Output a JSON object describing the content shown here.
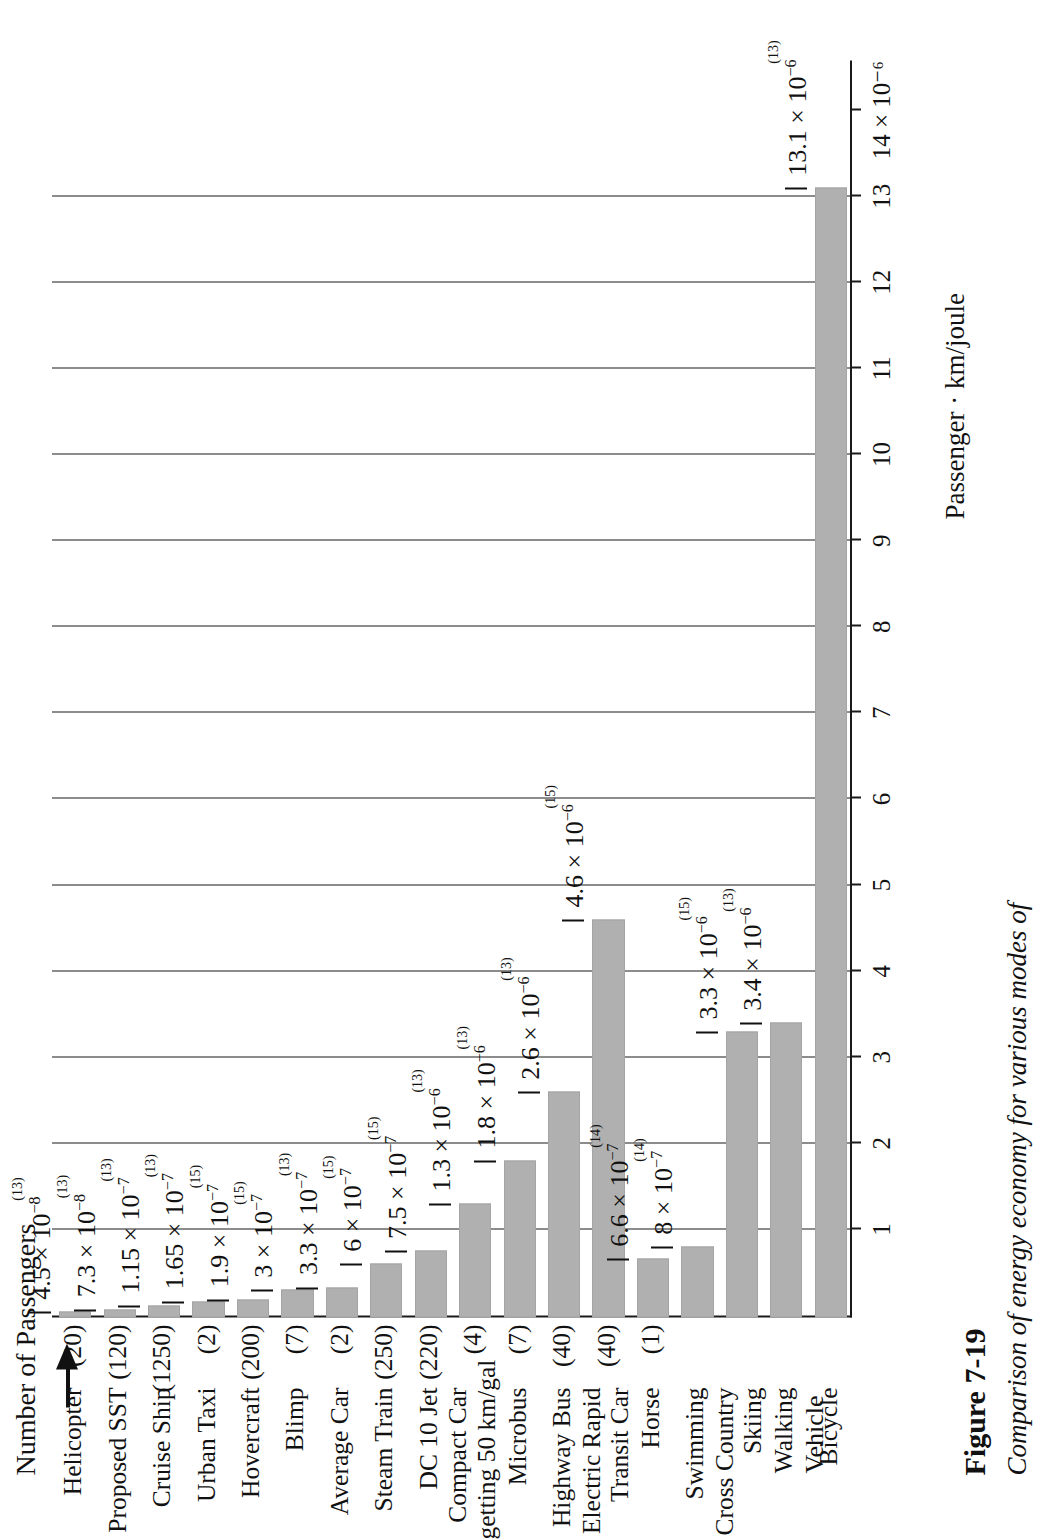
{
  "figure": {
    "number_label": "Figure 7-19",
    "caption": "Comparison of energy economy for various modes of",
    "vehicle_heading": "Vehicle",
    "passengers_heading": "Number of Passengers",
    "axis_title": "Passenger · km/joule",
    "bar_color": "#b0b0b0",
    "axis_color": "#1a1a1a"
  },
  "chart_data": {
    "type": "bar",
    "orientation": "horizontal",
    "xlabel": "Passenger · km/joule",
    "ylabel": "Vehicle",
    "unit_exponent": "10^-6",
    "xlim": [
      0,
      14.6
    ],
    "grid": true,
    "tick_values": [
      1,
      2,
      3,
      4,
      5,
      6,
      7,
      8,
      9,
      10,
      11,
      12,
      13,
      14
    ],
    "tick_labels": [
      "1",
      "2",
      "3",
      "4",
      "5",
      "6",
      "7",
      "8",
      "9",
      "10",
      "11",
      "12",
      "13",
      "14 × 10⁻⁶"
    ],
    "categories": [
      "Helicopter",
      "Proposed SST",
      "Cruise Ship",
      "Urban Taxi",
      "Hovercraft",
      "Blimp",
      "Average Car",
      "Steam Train",
      "DC 10 Jet",
      "Compact Car getting 50 km/gal",
      "Microbus",
      "Highway Bus",
      "Electric Rapid Transit Car",
      "Horse",
      "Swimming",
      "Cross Country Skiing",
      "Walking",
      "Bicycle"
    ],
    "values_in_1e6": [
      0.045,
      0.073,
      0.115,
      0.165,
      0.19,
      0.3,
      0.33,
      0.6,
      0.75,
      1.3,
      1.8,
      2.6,
      4.6,
      0.66,
      0.8,
      3.3,
      3.4,
      13.1
    ],
    "values": [
      4.5e-08,
      7.3e-08,
      1.15e-07,
      1.65e-07,
      1.9e-07,
      3e-07,
      3.3e-07,
      6e-07,
      7.5e-07,
      1.3e-06,
      1.8e-06,
      2.6e-06,
      4.6e-06,
      6.6e-07,
      8e-07,
      3.3e-06,
      3.4e-06,
      1.31e-05
    ]
  },
  "rows": [
    {
      "name": "Helicopter",
      "name_lines": [
        "Helicopter"
      ],
      "passengers": "(20)",
      "mant": "4.5",
      "exp": "−8",
      "ref": "(13)",
      "v": 0.045
    },
    {
      "name": "Proposed SST",
      "name_lines": [
        "Proposed SST"
      ],
      "passengers": "(120)",
      "mant": "7.3",
      "exp": "−8",
      "ref": "(13)",
      "v": 0.073
    },
    {
      "name": "Cruise Ship",
      "name_lines": [
        "Cruise Ship"
      ],
      "passengers": "(1250)",
      "mant": "1.15",
      "exp": "−7",
      "ref": "(13)",
      "v": 0.115
    },
    {
      "name": "Urban Taxi",
      "name_lines": [
        "Urban Taxi"
      ],
      "passengers": "(2)",
      "mant": "1.65",
      "exp": "−7",
      "ref": "(13)",
      "v": 0.165
    },
    {
      "name": "Hovercraft",
      "name_lines": [
        "Hovercraft"
      ],
      "passengers": "(200)",
      "mant": "1.9",
      "exp": "−7",
      "ref": "(15)",
      "v": 0.19
    },
    {
      "name": "Blimp",
      "name_lines": [
        "Blimp"
      ],
      "passengers": "(7)",
      "mant": "3",
      "exp": "−7",
      "ref": "(15)",
      "v": 0.3
    },
    {
      "name": "Average Car",
      "name_lines": [
        "Average Car"
      ],
      "passengers": "(2)",
      "mant": "3.3",
      "exp": "−7",
      "ref": "(13)",
      "v": 0.33
    },
    {
      "name": "Steam Train",
      "name_lines": [
        "Steam Train"
      ],
      "passengers": "(250)",
      "mant": "6",
      "exp": "−7",
      "ref": "(15)",
      "v": 0.6
    },
    {
      "name": "DC 10 Jet",
      "name_lines": [
        "DC 10 Jet"
      ],
      "passengers": "(220)",
      "mant": "7.5",
      "exp": "−7",
      "ref": "(15)",
      "v": 0.75
    },
    {
      "name": "Compact Car getting 50 km/gal",
      "name_lines": [
        "Compact Car",
        "getting 50 km/gal"
      ],
      "passengers": "(4)",
      "mant": "1.3",
      "exp": "−6",
      "ref": "(13)",
      "v": 1.3
    },
    {
      "name": "Microbus",
      "name_lines": [
        "Microbus"
      ],
      "passengers": "(7)",
      "mant": "1.8",
      "exp": "−6",
      "ref": "(13)",
      "v": 1.8
    },
    {
      "name": "Highway Bus",
      "name_lines": [
        "Highway Bus"
      ],
      "passengers": "(40)",
      "mant": "2.6",
      "exp": "−6",
      "ref": "(13)",
      "v": 2.6
    },
    {
      "name": "Electric Rapid Transit Car",
      "name_lines": [
        "Electric Rapid",
        "Transit Car"
      ],
      "passengers": "(40)",
      "mant": "4.6",
      "exp": "−6",
      "ref": "(15)",
      "v": 4.6
    },
    {
      "name": "Horse",
      "name_lines": [
        "Horse"
      ],
      "passengers": "(1)",
      "mant": "6.6",
      "exp": "−7",
      "ref": "(14)",
      "v": 0.66
    },
    {
      "name": "Swimming",
      "name_lines": [
        "Swimming"
      ],
      "passengers": "",
      "mant": "8",
      "exp": "−7",
      "ref": "(14)",
      "v": 0.8
    },
    {
      "name": "Cross Country Skiing",
      "name_lines": [
        "Cross Country",
        "Skiing"
      ],
      "passengers": "",
      "mant": "3.3",
      "exp": "−6",
      "ref": "(15)",
      "v": 3.3
    },
    {
      "name": "Walking",
      "name_lines": [
        "Walking"
      ],
      "passengers": "",
      "mant": "3.4",
      "exp": "−6",
      "ref": "(13)",
      "v": 3.4
    },
    {
      "name": "Bicycle",
      "name_lines": [
        "Bicycle"
      ],
      "passengers": "",
      "mant": "13.1",
      "exp": "−6",
      "ref": "(13)",
      "v": 13.1
    }
  ]
}
